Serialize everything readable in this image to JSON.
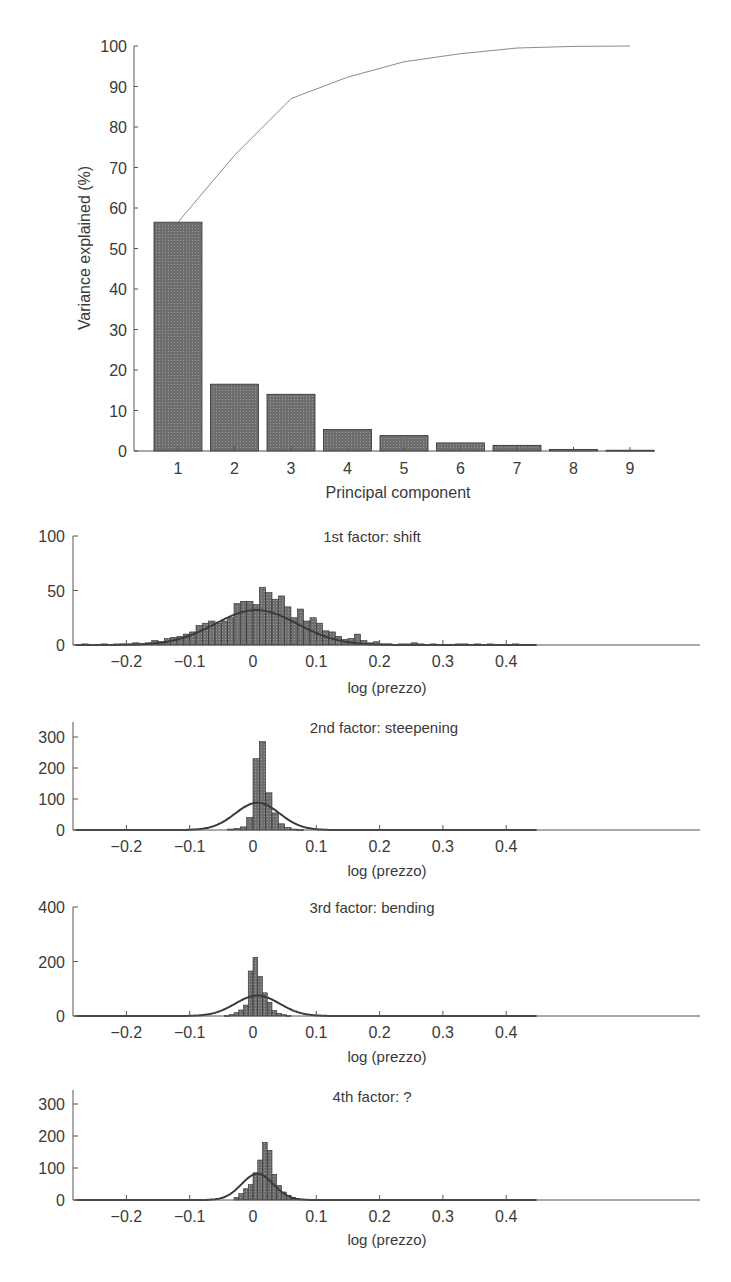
{
  "colors": {
    "bar_fill": "#6e6e6e",
    "bar_stroke": "#2e2e2e",
    "axis": "#555555",
    "cumulative_line": "#8a8a8a",
    "normal_curve": "#3a3a3a",
    "text": "#3a3a3a"
  },
  "chart_data": [
    {
      "id": "variance",
      "type": "bar",
      "title": "",
      "xlabel": "Principal component",
      "ylabel": "Variance explained (%)",
      "categories": [
        "1",
        "2",
        "3",
        "4",
        "5",
        "6",
        "7",
        "8",
        "9"
      ],
      "values": [
        56.5,
        16.5,
        14.0,
        5.3,
        3.8,
        2.0,
        1.4,
        0.4,
        0.2
      ],
      "cumulative": [
        56.5,
        73.0,
        87.0,
        92.3,
        96.1,
        98.1,
        99.5,
        99.9,
        100.0
      ],
      "ylim": [
        0,
        100
      ],
      "yticks": [
        0,
        10,
        20,
        30,
        40,
        50,
        60,
        70,
        80,
        90,
        100
      ],
      "grid": false,
      "legend": null
    },
    {
      "id": "factor1",
      "type": "bar",
      "subtype": "histogram_with_normal_fit",
      "title": "1st factor: shift",
      "xlabel": "log (prezzo)",
      "ylabel": "",
      "xlim": [
        -0.28,
        0.45
      ],
      "ylim": [
        0,
        100
      ],
      "xticks": [
        "-0.2",
        "-0.1",
        "0",
        "0.1",
        "0.2",
        "0.3",
        "0.4"
      ],
      "yticks": [
        0,
        50,
        100
      ],
      "bin_width": 0.01,
      "bin_start": -0.27,
      "counts": [
        1,
        0,
        0,
        1,
        0,
        1,
        1,
        1,
        2,
        1,
        2,
        4,
        3,
        6,
        7,
        8,
        10,
        12,
        18,
        20,
        22,
        20,
        22,
        25,
        38,
        40,
        40,
        37,
        53,
        48,
        42,
        45,
        35,
        25,
        33,
        22,
        25,
        20,
        13,
        12,
        8,
        5,
        6,
        10,
        4,
        2,
        3,
        1,
        1,
        0,
        1,
        1,
        2,
        1,
        0,
        1,
        0,
        0,
        0,
        1,
        1,
        0,
        1,
        0,
        1,
        0,
        0,
        0,
        1,
        0,
        0,
        0
      ],
      "normal_fit": {
        "mean": 0.005,
        "sd": 0.065,
        "peak": 32
      }
    },
    {
      "id": "factor2",
      "type": "bar",
      "subtype": "histogram_with_normal_fit",
      "title": "2nd factor: steepening",
      "xlabel": "log (prezzo)",
      "ylabel": "",
      "xlim": [
        -0.28,
        0.45
      ],
      "ylim": [
        0,
        350
      ],
      "xticks": [
        "-0.2",
        "-0.1",
        "0",
        "0.1",
        "0.2",
        "0.3",
        "0.4"
      ],
      "yticks": [
        0,
        100,
        200,
        300
      ],
      "bin_width": 0.01,
      "bin_start": -0.04,
      "counts": [
        3,
        5,
        10,
        40,
        230,
        285,
        120,
        55,
        20,
        8,
        3,
        1
      ],
      "normal_fit": {
        "mean": 0.007,
        "sd": 0.035,
        "peak": 88
      }
    },
    {
      "id": "factor3",
      "type": "bar",
      "subtype": "histogram_with_normal_fit",
      "title": "3rd factor: bending",
      "xlabel": "log (prezzo)",
      "ylabel": "",
      "xlim": [
        -0.28,
        0.45
      ],
      "ylim": [
        0,
        400
      ],
      "xticks": [
        "-0.2",
        "-0.1",
        "0",
        "0.1",
        "0.2",
        "0.3",
        "0.4"
      ],
      "yticks": [
        0,
        200,
        400
      ],
      "bin_width": 0.0075,
      "bin_start": -0.045,
      "counts": [
        2,
        5,
        12,
        22,
        40,
        165,
        215,
        145,
        85,
        50,
        20,
        10,
        5,
        2
      ],
      "normal_fit": {
        "mean": 0.007,
        "sd": 0.035,
        "peak": 75
      }
    },
    {
      "id": "factor4",
      "type": "bar",
      "subtype": "histogram_with_normal_fit",
      "title": "4th factor: ?",
      "xlabel": "log (prezzo)",
      "ylabel": "",
      "xlim": [
        -0.28,
        0.45
      ],
      "ylim": [
        0,
        350
      ],
      "xticks": [
        "-0.2",
        "-0.1",
        "0",
        "0.1",
        "0.2",
        "0.3",
        "0.4"
      ],
      "yticks": [
        0,
        100,
        200,
        300
      ],
      "bin_width": 0.0075,
      "bin_start": -0.03,
      "counts": [
        8,
        20,
        35,
        48,
        85,
        125,
        180,
        155,
        80,
        45,
        25,
        15,
        8,
        4
      ],
      "normal_fit": {
        "mean": 0.007,
        "sd": 0.025,
        "peak": 82
      }
    }
  ],
  "labels": {
    "variance_ylabel": "Variance explained (%)",
    "variance_xlabel": "Principal component",
    "factor1_title": "1st factor: shift",
    "factor2_title": "2nd factor: steepening",
    "factor3_title": "3rd factor: bending",
    "factor4_title": "4th factor: ?",
    "histogram_xlabel": "log (prezzo)"
  }
}
